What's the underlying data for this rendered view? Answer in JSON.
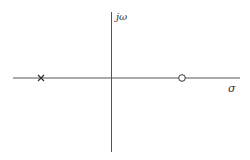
{
  "diagram": {
    "type": "pole-zero plot",
    "axes": {
      "real_axis_label": "σ",
      "imag_axis_label": "jω",
      "color": "#555555"
    },
    "markers": [
      {
        "kind": "pole",
        "symbol": "×",
        "position": "negative real axis",
        "color": "#333333"
      },
      {
        "kind": "zero",
        "symbol": "○",
        "position": "positive real axis",
        "color": "#333333"
      }
    ]
  }
}
